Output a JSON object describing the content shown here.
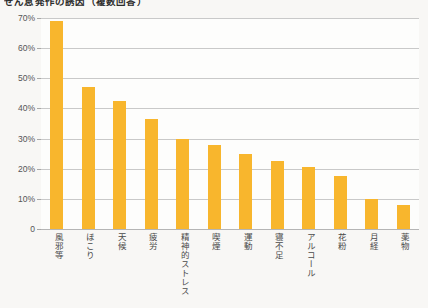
{
  "chart_data": {
    "type": "bar",
    "title": "ぜん息発作の誘因（複数回答）",
    "xlabel": "",
    "ylabel": "",
    "ylim": [
      0,
      70
    ],
    "grid": true,
    "legend": "none",
    "orientation": "vertical",
    "bar_color": "#f8b62d",
    "categories": [
      "風邪等",
      "ほこり",
      "天候",
      "疲労",
      "精神的ストレス",
      "喫煙",
      "運動",
      "寝不足",
      "アルコール",
      "花粉",
      "月経",
      "薬物"
    ],
    "values": [
      69,
      47,
      42.5,
      36.5,
      30,
      28,
      25,
      22.5,
      20.5,
      17.5,
      10,
      8
    ],
    "yticks": [
      0,
      10,
      20,
      30,
      40,
      50,
      60,
      70
    ],
    "ytick_labels": [
      "0",
      "10%",
      "20%",
      "30%",
      "40%",
      "50%",
      "60%",
      "70%"
    ]
  },
  "style": {
    "background": "#f8f7f5",
    "plot_background": "#fdfdfc",
    "gridline_color": "#c9c9c9",
    "axis_color": "#b0b0b0",
    "text_color": "#4a4a4a"
  }
}
